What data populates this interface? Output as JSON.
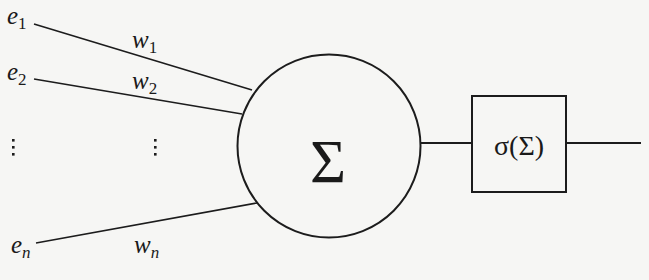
{
  "diagram": {
    "title": "",
    "type": "artificial-neuron",
    "colors": {
      "background": "#f6f6f4",
      "ink": "#1c1c1c"
    },
    "inputs": [
      {
        "label_base": "e",
        "label_sub": "1",
        "weight_base": "w",
        "weight_sub": "1"
      },
      {
        "label_base": "e",
        "label_sub": "2",
        "weight_base": "w",
        "weight_sub": "2"
      },
      {
        "label_base": "e",
        "label_sub": "n",
        "weight_base": "w",
        "weight_sub": "n"
      }
    ],
    "ellipsis_symbol": "⋮",
    "summation": {
      "symbol": "Σ"
    },
    "activation": {
      "label": "σ(Σ)"
    }
  }
}
